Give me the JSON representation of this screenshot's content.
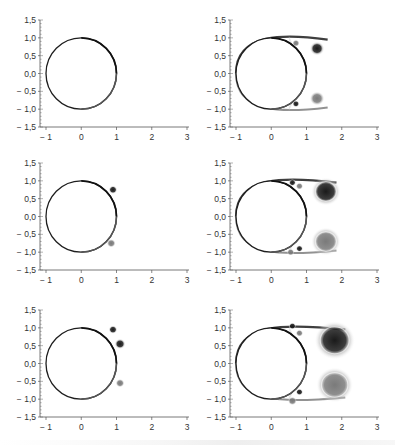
{
  "figure": {
    "layout": {
      "rows": 3,
      "cols": 2
    },
    "axes": {
      "x_ticks": [
        "-1",
        "0",
        "1",
        "2",
        "3"
      ],
      "x_values": [
        -1,
        0,
        1,
        2,
        3
      ],
      "y_ticks": [
        "1,5",
        "1,0",
        "0,5",
        "0,0",
        "-0,5",
        "-1,0",
        "-1,5"
      ],
      "y_values": [
        1.5,
        1.0,
        0.5,
        0.0,
        -0.5,
        -1.0,
        -1.5
      ],
      "xlim": [
        -1,
        3
      ],
      "ylim": [
        -1.5,
        1.5
      ]
    }
  },
  "chart_data": [
    {
      "type": "heatmap",
      "panel": "row1-left",
      "title": "",
      "xlabel": "",
      "ylabel": "",
      "xlim": [
        -1,
        3
      ],
      "ylim": [
        -1.5,
        1.5
      ],
      "cylinder": {
        "center": [
          0,
          0
        ],
        "radius": 1
      },
      "vortices": [],
      "description": "thin vorticity layer on cylinder surface, separating near x=1"
    },
    {
      "type": "heatmap",
      "panel": "row1-right",
      "title": "",
      "xlabel": "",
      "ylabel": "",
      "xlim": [
        -1,
        3
      ],
      "ylim": [
        -1.5,
        1.5
      ],
      "cylinder": {
        "center": [
          0,
          0
        ],
        "radius": 1
      },
      "vortices": [
        {
          "x": 1.3,
          "y": 0.7,
          "r": 0.2,
          "shade": "dark"
        },
        {
          "x": 1.3,
          "y": -0.7,
          "r": 0.2,
          "shade": "gray"
        },
        {
          "x": 0.7,
          "y": 0.85,
          "r": 0.1,
          "shade": "gray"
        },
        {
          "x": 0.7,
          "y": -0.85,
          "r": 0.1,
          "shade": "dark"
        }
      ]
    },
    {
      "type": "heatmap",
      "panel": "row2-left",
      "title": "",
      "xlabel": "",
      "ylabel": "",
      "xlim": [
        -1,
        3
      ],
      "ylim": [
        -1.5,
        1.5
      ],
      "cylinder": {
        "center": [
          0,
          0
        ],
        "radius": 1
      },
      "vortices": [
        {
          "x": 0.9,
          "y": 0.75,
          "r": 0.12,
          "shade": "dark"
        },
        {
          "x": 0.85,
          "y": -0.75,
          "r": 0.12,
          "shade": "gray"
        }
      ]
    },
    {
      "type": "heatmap",
      "panel": "row2-right",
      "title": "",
      "xlabel": "",
      "ylabel": "",
      "xlim": [
        -1,
        3
      ],
      "ylim": [
        -1.5,
        1.5
      ],
      "cylinder": {
        "center": [
          0,
          0
        ],
        "radius": 1
      },
      "vortices": [
        {
          "x": 1.55,
          "y": 0.7,
          "r": 0.4,
          "shade": "dark"
        },
        {
          "x": 1.55,
          "y": -0.7,
          "r": 0.4,
          "shade": "gray"
        },
        {
          "x": 0.6,
          "y": 0.95,
          "r": 0.1,
          "shade": "dark"
        },
        {
          "x": 0.8,
          "y": 0.85,
          "r": 0.1,
          "shade": "gray"
        },
        {
          "x": 0.8,
          "y": -0.9,
          "r": 0.1,
          "shade": "dark"
        },
        {
          "x": 0.55,
          "y": -1.0,
          "r": 0.1,
          "shade": "gray"
        }
      ]
    },
    {
      "type": "heatmap",
      "panel": "row3-left",
      "title": "",
      "xlabel": "",
      "ylabel": "",
      "xlim": [
        -1,
        3
      ],
      "ylim": [
        -1.5,
        1.5
      ],
      "cylinder": {
        "center": [
          0,
          0
        ],
        "radius": 1
      },
      "vortices": [
        {
          "x": 1.1,
          "y": 0.55,
          "r": 0.15,
          "shade": "dark"
        },
        {
          "x": 1.1,
          "y": -0.55,
          "r": 0.12,
          "shade": "gray"
        },
        {
          "x": 0.9,
          "y": 0.95,
          "r": 0.12,
          "shade": "dark"
        }
      ]
    },
    {
      "type": "heatmap",
      "panel": "row3-right",
      "title": "",
      "xlabel": "",
      "ylabel": "",
      "xlim": [
        -1,
        3
      ],
      "ylim": [
        -1.5,
        1.5
      ],
      "cylinder": {
        "center": [
          0,
          0
        ],
        "radius": 1
      },
      "vortices": [
        {
          "x": 1.8,
          "y": 0.65,
          "r": 0.55,
          "shade": "dark"
        },
        {
          "x": 1.8,
          "y": -0.6,
          "r": 0.5,
          "shade": "gray"
        },
        {
          "x": 0.6,
          "y": 1.05,
          "r": 0.1,
          "shade": "dark"
        },
        {
          "x": 0.8,
          "y": 0.85,
          "r": 0.1,
          "shade": "gray"
        },
        {
          "x": 0.8,
          "y": -0.8,
          "r": 0.1,
          "shade": "dark"
        },
        {
          "x": 0.6,
          "y": -1.05,
          "r": 0.12,
          "shade": "gray"
        }
      ]
    }
  ]
}
